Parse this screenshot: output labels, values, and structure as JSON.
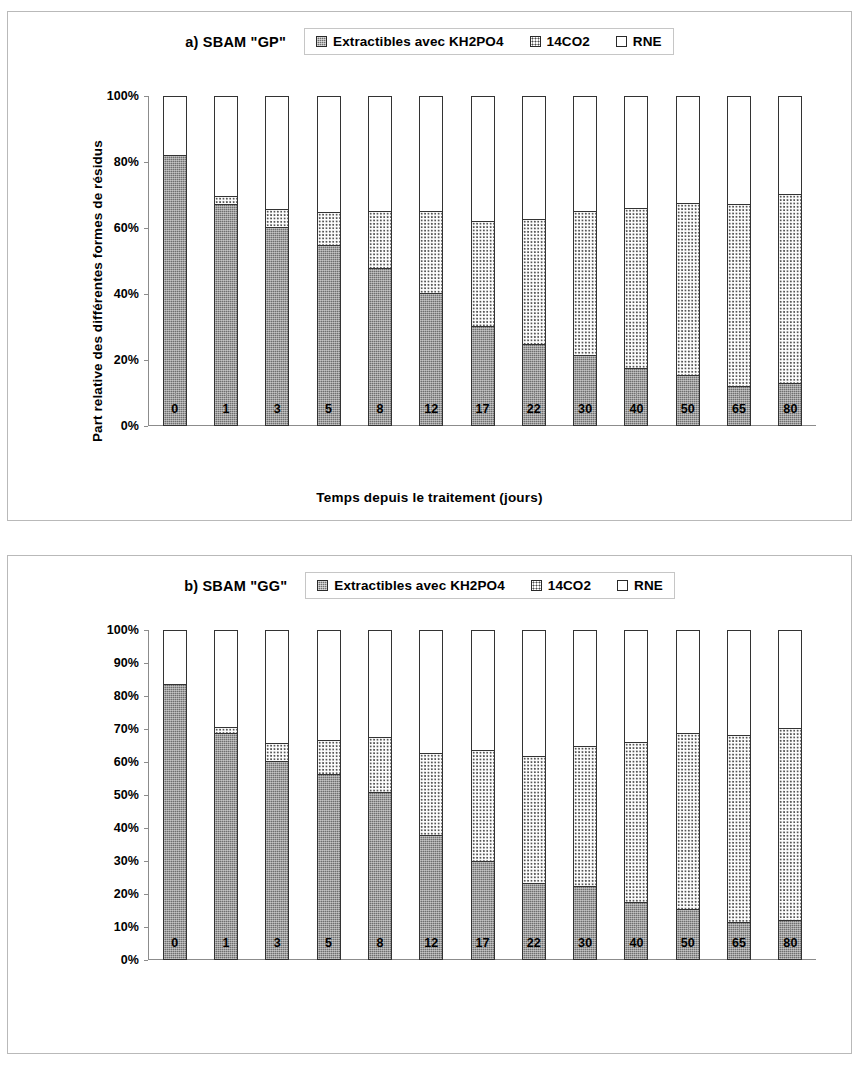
{
  "figure": {
    "y_axis_title": "Part relative des différentes formes de résidus",
    "x_axis_title": "Temps depuis le traitement (jours)",
    "legend_items": [
      {
        "label": "Extractibles avec KH2PO4",
        "swatch": "dark-hatch-swatch",
        "color": "#6f6f6f"
      },
      {
        "label": "14CO2",
        "swatch": "dotted-swatch",
        "color": "#ffffff"
      },
      {
        "label": "RNE",
        "swatch": "white-swatch",
        "color": "#ffffff"
      }
    ]
  },
  "panel_a": {
    "label": "a) SBAM \"GP\"",
    "y_ticks": [
      "100%",
      "80%",
      "60%",
      "40%",
      "20%",
      "0%"
    ],
    "x_ticks": [
      "0",
      "1",
      "3",
      "5",
      "8",
      "12",
      "17",
      "22",
      "30",
      "40",
      "50",
      "65",
      "80"
    ]
  },
  "panel_b": {
    "label": "b) SBAM \"GG\"",
    "y_ticks": [
      "100%",
      "90%",
      "80%",
      "70%",
      "60%",
      "50%",
      "40%",
      "30%",
      "20%",
      "10%",
      "0%"
    ],
    "x_ticks": [
      "0",
      "1",
      "3",
      "5",
      "8",
      "12",
      "17",
      "22",
      "30",
      "40",
      "50",
      "65",
      "80"
    ]
  },
  "chart_data": [
    {
      "id": "panel_a",
      "type": "bar",
      "stacked": true,
      "title": "a) SBAM \"GP\"",
      "xlabel": "Temps depuis le traitement (jours)",
      "ylabel": "Part relative des différentes formes de résidus",
      "ylim": [
        0,
        100
      ],
      "ytick_interval": 20,
      "grid": false,
      "legend_position": "top",
      "categories": [
        "0",
        "1",
        "3",
        "5",
        "8",
        "12",
        "17",
        "22",
        "30",
        "40",
        "50",
        "65",
        "80"
      ],
      "series": [
        {
          "name": "Extractibles avec KH2PO4",
          "values": [
            82,
            67,
            60,
            54.5,
            47.5,
            40,
            30,
            24.5,
            21,
            17,
            15,
            11.5,
            12.5
          ]
        },
        {
          "name": "14CO2",
          "values": [
            0,
            2.5,
            5.5,
            10,
            17.5,
            25,
            32,
            38,
            44,
            49,
            52.5,
            55.5,
            57.5
          ]
        },
        {
          "name": "RNE",
          "values": [
            18,
            30.5,
            34.5,
            35.5,
            35,
            35,
            38,
            37.5,
            35,
            34,
            32.5,
            33,
            30
          ]
        }
      ],
      "cumulative_tops": {
        "extractibles": [
          82,
          67,
          60,
          54.5,
          47.5,
          40,
          30,
          24.5,
          21,
          17,
          15,
          11.5,
          12.5
        ],
        "extractibles_plus_co2": [
          82,
          69.5,
          65.5,
          64.5,
          65,
          65,
          62,
          62.5,
          65,
          66,
          67.5,
          67,
          70
        ],
        "total": [
          100,
          100,
          100,
          100,
          100,
          100,
          100,
          100,
          100,
          100,
          100,
          100,
          100
        ]
      }
    },
    {
      "id": "panel_b",
      "type": "bar",
      "stacked": true,
      "title": "b) SBAM \"GG\"",
      "xlabel": "Temps depuis le traitement (jours)",
      "ylabel": "Part relative des différentes formes de résidus",
      "ylim": [
        0,
        100
      ],
      "ytick_interval": 10,
      "grid": false,
      "legend_position": "top",
      "categories": [
        "0",
        "1",
        "3",
        "5",
        "8",
        "12",
        "17",
        "22",
        "30",
        "40",
        "50",
        "65",
        "80"
      ],
      "series": [
        {
          "name": "Extractibles avec KH2PO4",
          "values": [
            83.5,
            68.5,
            60,
            56,
            50.5,
            37.5,
            29.5,
            23,
            22,
            17,
            15,
            11,
            11.5
          ]
        },
        {
          "name": "14CO2",
          "values": [
            0,
            2,
            5.5,
            10.5,
            17,
            25,
            34,
            38.5,
            42.5,
            49,
            53.5,
            57,
            58.5
          ]
        },
        {
          "name": "RNE",
          "values": [
            16.5,
            29.5,
            34.5,
            33.5,
            32.5,
            37.5,
            36.5,
            38.5,
            35.5,
            34,
            31.5,
            32,
            30
          ]
        }
      ],
      "cumulative_tops": {
        "extractibles": [
          83.5,
          68.5,
          60,
          56,
          50.5,
          37.5,
          29.5,
          23,
          22,
          17,
          15,
          11,
          11.5
        ],
        "extractibles_plus_co2": [
          83.5,
          70.5,
          65.5,
          66.5,
          67.5,
          62.5,
          63.5,
          61.5,
          64.5,
          66,
          68.5,
          68,
          70
        ],
        "total": [
          100,
          100,
          100,
          100,
          100,
          100,
          100,
          100,
          100,
          100,
          100,
          100,
          100
        ]
      }
    }
  ]
}
